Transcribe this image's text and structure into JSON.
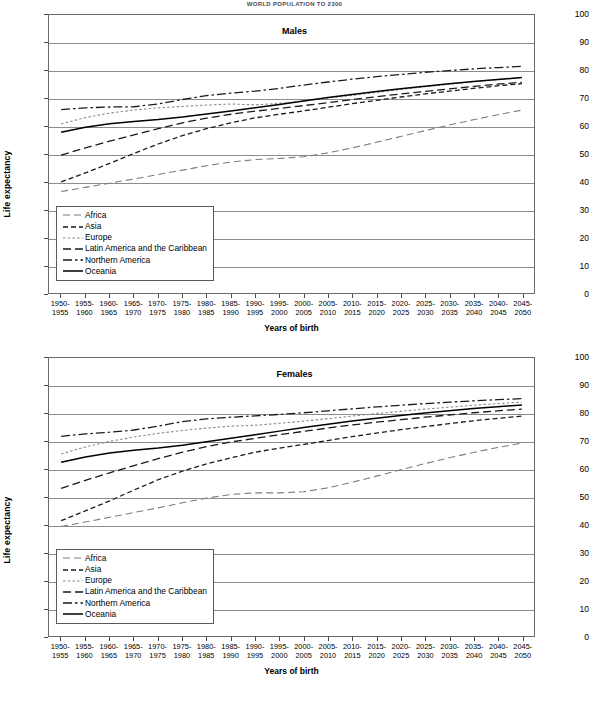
{
  "document": {
    "running_head": "WORLD POPULATION TO 2300"
  },
  "chart_data": [
    {
      "id": "males",
      "type": "line",
      "title": "Males",
      "xlabel": "Years of birth",
      "ylabel": "Life expectancy",
      "ylim": [
        0,
        100
      ],
      "yticks": [
        0,
        10,
        20,
        30,
        40,
        50,
        60,
        70,
        80,
        90,
        100
      ],
      "grid": true,
      "legend_position": "inside-lower-left",
      "categories": [
        "1950-1955",
        "1955-1960",
        "1960-1965",
        "1965-1970",
        "1970-1975",
        "1975-1980",
        "1980-1985",
        "1985-1990",
        "1990-1995",
        "1995-2000",
        "2000-2005",
        "2005-2010",
        "2010-2015",
        "2015-2020",
        "2020-2025",
        "2025-2030",
        "2030-2035",
        "2035-2040",
        "2040-2045",
        "2045-2050"
      ],
      "series": [
        {
          "name": "Africa",
          "style": "long-dash-light",
          "color": "#7d7d7d",
          "values": [
            36.5,
            38.0,
            39.5,
            41.0,
            42.6,
            44.2,
            45.8,
            47.1,
            48.0,
            48.4,
            49.0,
            50.4,
            52.2,
            54.2,
            56.3,
            58.4,
            60.4,
            62.3,
            64.1,
            65.8
          ]
        },
        {
          "name": "Asia",
          "style": "dash",
          "color": "#1a1a1a",
          "values": [
            40.0,
            43.2,
            46.6,
            50.2,
            53.6,
            56.6,
            59.1,
            61.2,
            63.0,
            64.3,
            65.5,
            66.8,
            68.1,
            69.3,
            70.5,
            71.6,
            72.6,
            73.6,
            74.5,
            75.3
          ]
        },
        {
          "name": "Europe",
          "style": "dot",
          "color": "#8a8a8a",
          "values": [
            60.8,
            63.1,
            64.7,
            65.8,
            66.6,
            67.1,
            67.6,
            68.0,
            67.7,
            68.2,
            69.1,
            70.1,
            71.1,
            72.1,
            73.2,
            74.2,
            75.1,
            76.0,
            76.8,
            77.5
          ]
        },
        {
          "name": "Latin America and the Caribbean",
          "style": "dash-wide",
          "color": "#1a1a1a",
          "values": [
            49.6,
            52.2,
            54.6,
            56.9,
            59.1,
            61.2,
            62.9,
            64.3,
            65.4,
            66.4,
            67.4,
            68.5,
            69.6,
            70.6,
            71.6,
            72.5,
            73.4,
            74.3,
            75.1,
            75.8
          ]
        },
        {
          "name": "Northern America",
          "style": "dash-dot",
          "color": "#1a1a1a",
          "values": [
            66.0,
            66.6,
            66.9,
            67.0,
            68.0,
            69.6,
            71.0,
            71.9,
            72.6,
            73.6,
            74.8,
            75.9,
            76.9,
            77.8,
            78.6,
            79.4,
            80.0,
            80.6,
            81.1,
            81.5
          ]
        },
        {
          "name": "Oceania",
          "style": "solid",
          "color": "#000000",
          "values": [
            57.8,
            59.6,
            60.9,
            61.7,
            62.4,
            63.3,
            64.4,
            65.5,
            66.6,
            67.8,
            69.1,
            70.3,
            71.4,
            72.5,
            73.5,
            74.4,
            75.3,
            76.1,
            76.8,
            77.5
          ]
        }
      ]
    },
    {
      "id": "females",
      "type": "line",
      "title": "Females",
      "xlabel": "Years of birth",
      "ylabel": "Life expectancy",
      "ylim": [
        0,
        100
      ],
      "yticks": [
        0,
        10,
        20,
        30,
        40,
        50,
        60,
        70,
        80,
        90,
        100
      ],
      "grid": true,
      "legend_position": "inside-lower-left",
      "categories": [
        "1950-1955",
        "1955-1960",
        "1960-1965",
        "1965-1970",
        "1970-1975",
        "1975-1980",
        "1980-1985",
        "1985-1990",
        "1990-1995",
        "1995-2000",
        "2000-2005",
        "2005-2010",
        "2010-2015",
        "2015-2020",
        "2020-2025",
        "2025-2030",
        "2030-2035",
        "2035-2040",
        "2040-2045",
        "2045-2050"
      ],
      "series": [
        {
          "name": "Africa",
          "style": "long-dash-light",
          "color": "#7d7d7d",
          "values": [
            39.4,
            41.0,
            42.7,
            44.4,
            46.1,
            47.9,
            49.6,
            50.9,
            51.5,
            51.5,
            51.9,
            53.3,
            55.3,
            57.5,
            59.8,
            62.0,
            64.1,
            66.0,
            67.8,
            69.4
          ]
        },
        {
          "name": "Asia",
          "style": "dash",
          "color": "#1a1a1a",
          "values": [
            41.5,
            45.0,
            48.6,
            52.5,
            56.2,
            59.3,
            61.9,
            64.1,
            66.1,
            67.6,
            68.9,
            70.3,
            71.7,
            73.0,
            74.2,
            75.3,
            76.4,
            77.4,
            78.3,
            79.1
          ]
        },
        {
          "name": "Europe",
          "style": "dot",
          "color": "#8a8a8a",
          "values": [
            65.5,
            68.0,
            70.0,
            71.6,
            72.9,
            73.9,
            74.8,
            75.5,
            75.8,
            76.5,
            77.3,
            78.2,
            79.1,
            80.0,
            80.8,
            81.6,
            82.3,
            83.0,
            83.6,
            84.1
          ]
        },
        {
          "name": "Latin America and the Caribbean",
          "style": "dash-wide",
          "color": "#1a1a1a",
          "values": [
            53.1,
            56.0,
            58.7,
            61.3,
            63.8,
            66.1,
            68.1,
            69.8,
            71.1,
            72.4,
            73.6,
            74.8,
            75.9,
            76.9,
            77.8,
            78.7,
            79.5,
            80.3,
            81.0,
            81.6
          ]
        },
        {
          "name": "Northern America",
          "style": "dash-dot",
          "color": "#1a1a1a",
          "values": [
            71.8,
            72.7,
            73.3,
            74.1,
            75.5,
            77.1,
            78.1,
            78.7,
            79.2,
            79.7,
            80.3,
            81.0,
            81.7,
            82.4,
            83.0,
            83.6,
            84.1,
            84.6,
            85.0,
            85.4
          ]
        },
        {
          "name": "Oceania",
          "style": "solid",
          "color": "#000000",
          "values": [
            62.5,
            64.4,
            65.8,
            66.8,
            67.6,
            68.6,
            69.9,
            71.1,
            72.4,
            73.7,
            75.0,
            76.2,
            77.3,
            78.3,
            79.3,
            80.2,
            81.0,
            81.8,
            82.5,
            83.1
          ]
        }
      ]
    }
  ]
}
